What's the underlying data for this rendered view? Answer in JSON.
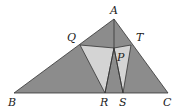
{
  "figure": {
    "colors": {
      "dark": "#8c8c8c",
      "light": "#d4d4d4",
      "stroke": "#333333"
    },
    "labels": {
      "A": "A",
      "B": "B",
      "C": "C",
      "Q": "Q",
      "T": "T",
      "P": "P",
      "R": "R",
      "S": "S"
    }
  }
}
